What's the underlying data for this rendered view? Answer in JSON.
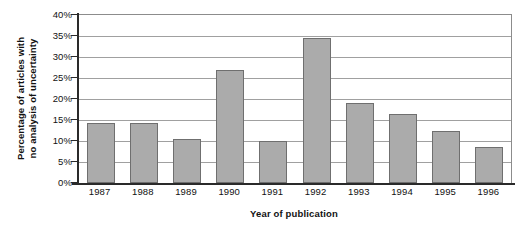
{
  "chart_data": {
    "type": "bar",
    "title": "",
    "xlabel": "Year of publication",
    "ylabel_line1": "Percentage of articles with",
    "ylabel_line2": "no analysis of uncertainty",
    "categories": [
      "1987",
      "1988",
      "1989",
      "1990",
      "1991",
      "1992",
      "1993",
      "1994",
      "1995",
      "1996"
    ],
    "values": [
      14.2,
      14.2,
      10.5,
      27.0,
      10.0,
      34.5,
      19.0,
      16.5,
      12.5,
      8.5
    ],
    "ylim": [
      0,
      40
    ],
    "ytick_values": [
      0,
      5,
      10,
      15,
      20,
      25,
      30,
      35,
      40
    ],
    "ytick_labels": [
      "0%",
      "5%",
      "10%",
      "15%",
      "20%",
      "25%",
      "30%",
      "35%",
      "40%"
    ],
    "grid": true,
    "legend": "none",
    "bar_color": "#ababab",
    "bar_border_color": "#6f6f6f",
    "gridline_color": "#a0a0a0",
    "axis_color": "#2a2a2a",
    "plot_background": "#ffffff"
  }
}
